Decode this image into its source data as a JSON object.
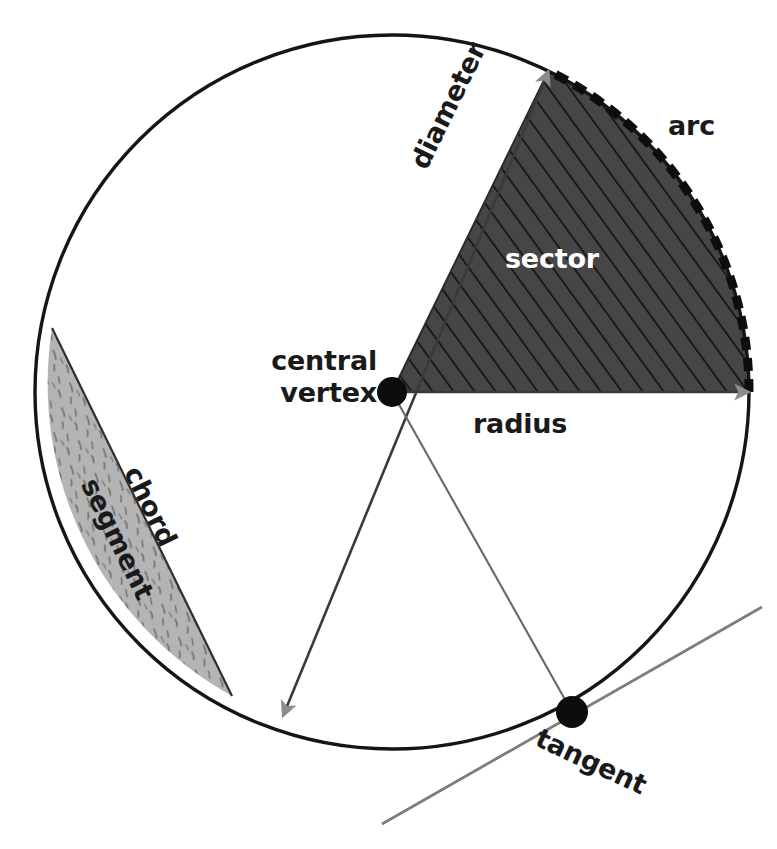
{
  "figure": {
    "canvas": {
      "width": 777,
      "height": 849
    }
  },
  "colors": {
    "background": "#ffffff",
    "outline": "#151515",
    "sector_fill": "#464646",
    "sector_hatch": "#101010",
    "arc_highlight": "#0d0d0d",
    "segment_fill": "#b3b3b3",
    "segment_speckle": "#6f6f6f",
    "thin_line": "#6b6b6b",
    "arrowhead": "#8c8c8c",
    "vertex_dot": "#0d0d0d",
    "label_dark": "#1a1a1a",
    "label_light": "#ffffff"
  },
  "geometry": {
    "circle": {
      "cx": 392,
      "cy": 392,
      "r": 357
    },
    "central_vertex_point": {
      "x": 392,
      "y": 392,
      "dot_radius": 15
    },
    "tangent_point": {
      "x": 572,
      "y": 712,
      "dot_radius": 16
    },
    "sector": {
      "start_angle_deg": 0,
      "end_angle_deg": -64
    },
    "arc": {
      "start_angle_deg": -64,
      "end_angle_deg": 0
    },
    "diameter_endpoints": [
      {
        "x": 548,
        "y": 71
      },
      {
        "x": 283,
        "y": 716
      }
    ],
    "radius_endpoint": {
      "x": 749,
      "y": 392
    },
    "chord_endpoints": [
      {
        "x": 52,
        "y": 328
      },
      {
        "x": 232,
        "y": 696
      }
    ],
    "tangent_line": [
      {
        "x": 382,
        "y": 824
      },
      {
        "x": 760,
        "y": 608
      }
    ]
  },
  "labels": {
    "central_vertex": "central\nvertex",
    "radius": "radius",
    "arc": "arc",
    "sector": "sector",
    "diameter": "diameter",
    "chord": "chord",
    "segment": "segment",
    "tangent": "tangent"
  },
  "chart_data": {
    "type": "diagram",
    "parts": [
      {
        "name": "central vertex",
        "description": "center point of the circle",
        "marker": "filled dot"
      },
      {
        "name": "radius",
        "description": "segment from center to circle edge",
        "marker": "arrow line"
      },
      {
        "name": "diameter",
        "description": "chord passing through the center",
        "marker": "double arrow line"
      },
      {
        "name": "arc",
        "description": "portion of the circumference",
        "marker": "thick dashed curve"
      },
      {
        "name": "sector",
        "description": "region bounded by two radii and an arc",
        "marker": "dark hatched region"
      },
      {
        "name": "chord",
        "description": "segment joining two points on the circle",
        "marker": "straight line"
      },
      {
        "name": "segment",
        "description": "region between a chord and its arc",
        "marker": "light speckled region"
      },
      {
        "name": "tangent",
        "description": "line touching the circle at exactly one point",
        "marker": "gray line with dot"
      }
    ]
  }
}
